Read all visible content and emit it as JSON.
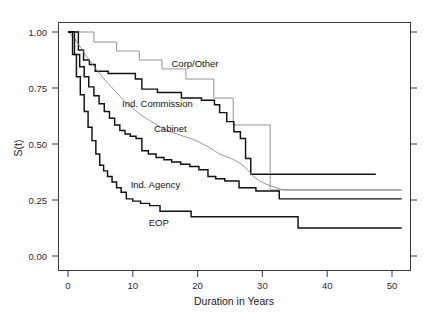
{
  "chart_data": {
    "type": "line",
    "title": "",
    "xlabel": "Duration in Years",
    "ylabel": "S(t)",
    "xlim": [
      0,
      52
    ],
    "ylim": [
      0,
      1.0
    ],
    "xticks": [
      0,
      10,
      20,
      30,
      40,
      50
    ],
    "xtick_labels": [
      "0",
      "10",
      "20",
      "30",
      "40",
      "50"
    ],
    "yticks": [
      0.0,
      0.25,
      0.5,
      0.75,
      1.0
    ],
    "ytick_labels": [
      "0.00",
      "0.25",
      "0.50",
      "0.75",
      "1.00"
    ],
    "grid": false,
    "legend_position": "inline-annotations",
    "step_style": "post",
    "series": [
      {
        "name": "Corp/Other",
        "style": "thin-gray",
        "color": "#8a8a8a",
        "label_x": 19.6,
        "label_y": 0.845,
        "x": [
          0,
          1.0,
          4.0,
          4.0,
          7.5,
          7.5,
          11.0,
          11.0,
          14.5,
          14.5,
          18.2,
          18.2,
          22.5,
          22.5,
          25.5,
          25.5,
          30.8,
          30.8,
          31.2,
          31.2,
          38.0,
          46.0,
          51.5
        ],
        "y": [
          1.0,
          1.0,
          1.0,
          0.955,
          0.955,
          0.915,
          0.915,
          0.875,
          0.875,
          0.835,
          0.835,
          0.79,
          0.79,
          0.705,
          0.705,
          0.585,
          0.585,
          0.585,
          0.585,
          0.295,
          0.295,
          0.295,
          0.295
        ]
      },
      {
        "name": "Ind. Commission",
        "style": "thick",
        "color": "#111111",
        "label_x": 13.8,
        "label_y": 0.663,
        "x": [
          0,
          1.6,
          1.6,
          2.4,
          2.4,
          3.3,
          3.3,
          4.2,
          4.2,
          6.2,
          6.2,
          10.4,
          10.4,
          11.4,
          11.4,
          13.8,
          13.8,
          17.5,
          17.5,
          20.6,
          20.6,
          22.6,
          22.6,
          23.4,
          23.4,
          24.5,
          24.5,
          25.6,
          25.6,
          26.6,
          26.6,
          27.4,
          27.4,
          28.2,
          28.2,
          33.0,
          40.0,
          47.5
        ],
        "y": [
          1.0,
          1.0,
          0.92,
          0.92,
          0.875,
          0.875,
          0.855,
          0.855,
          0.825,
          0.825,
          0.815,
          0.815,
          0.79,
          0.79,
          0.745,
          0.745,
          0.73,
          0.73,
          0.705,
          0.705,
          0.695,
          0.695,
          0.675,
          0.675,
          0.64,
          0.64,
          0.6,
          0.6,
          0.555,
          0.555,
          0.525,
          0.525,
          0.435,
          0.435,
          0.365,
          0.365,
          0.365,
          0.365
        ]
      },
      {
        "name": "Cabinet",
        "style": "thin-gray",
        "color": "#777777",
        "label_x": 15.8,
        "label_y": 0.555,
        "x": [
          0,
          0.9,
          1.5,
          2.2,
          3.0,
          3.8,
          4.6,
          5.4,
          6.2,
          7.0,
          7.8,
          8.6,
          9.4,
          10.2,
          11.0,
          11.8,
          12.6,
          13.4,
          14.2,
          15.0,
          15.8,
          16.8,
          17.8,
          18.8,
          19.8,
          20.8,
          21.8,
          22.6,
          23.4,
          24.3,
          25.2,
          26.2,
          27.2,
          28.0,
          28.6,
          29.6,
          30.6,
          31.6,
          32.6,
          33.2,
          36.0,
          42.0,
          48.0,
          51.5
        ],
        "y": [
          1.0,
          0.975,
          0.95,
          0.92,
          0.885,
          0.855,
          0.825,
          0.795,
          0.77,
          0.745,
          0.72,
          0.695,
          0.675,
          0.655,
          0.635,
          0.62,
          0.605,
          0.59,
          0.578,
          0.565,
          0.555,
          0.545,
          0.535,
          0.525,
          0.515,
          0.5,
          0.485,
          0.47,
          0.455,
          0.445,
          0.435,
          0.42,
          0.4,
          0.375,
          0.355,
          0.335,
          0.32,
          0.31,
          0.3,
          0.295,
          0.295,
          0.295,
          0.295,
          0.295
        ]
      },
      {
        "name": "Ind. Agency",
        "style": "thick",
        "color": "#111111",
        "label_x": 13.5,
        "label_y": 0.305,
        "x": [
          0,
          1.0,
          1.0,
          1.8,
          1.8,
          2.5,
          2.5,
          3.2,
          3.2,
          4.0,
          4.0,
          4.8,
          4.8,
          5.6,
          5.6,
          6.4,
          6.4,
          7.2,
          7.2,
          8.0,
          8.0,
          8.8,
          8.8,
          9.6,
          9.6,
          10.5,
          10.5,
          11.4,
          11.4,
          12.4,
          12.4,
          13.6,
          13.6,
          14.8,
          14.8,
          16.0,
          16.0,
          17.4,
          17.4,
          18.8,
          18.8,
          20.2,
          20.2,
          21.6,
          21.6,
          22.8,
          22.8,
          24.2,
          24.2,
          26.4,
          26.4,
          29.0,
          29.0,
          32.6,
          32.6,
          38.0,
          44.0,
          51.5
        ],
        "y": [
          1.0,
          1.0,
          0.9,
          0.9,
          0.845,
          0.845,
          0.8,
          0.8,
          0.755,
          0.755,
          0.715,
          0.715,
          0.68,
          0.68,
          0.645,
          0.645,
          0.615,
          0.615,
          0.585,
          0.585,
          0.56,
          0.56,
          0.545,
          0.545,
          0.535,
          0.535,
          0.525,
          0.525,
          0.47,
          0.47,
          0.455,
          0.455,
          0.44,
          0.44,
          0.43,
          0.43,
          0.42,
          0.42,
          0.41,
          0.41,
          0.4,
          0.4,
          0.385,
          0.385,
          0.355,
          0.355,
          0.345,
          0.345,
          0.335,
          0.335,
          0.305,
          0.305,
          0.29,
          0.29,
          0.255,
          0.255,
          0.255,
          0.255
        ]
      },
      {
        "name": "EOP",
        "style": "thick",
        "color": "#111111",
        "label_x": 14.0,
        "label_y": 0.135,
        "x": [
          0,
          0.7,
          0.7,
          1.3,
          1.3,
          1.9,
          1.9,
          2.5,
          2.5,
          3.1,
          3.1,
          3.7,
          3.7,
          4.3,
          4.3,
          4.9,
          4.9,
          5.5,
          5.5,
          6.1,
          6.1,
          6.8,
          6.8,
          7.5,
          7.5,
          8.2,
          8.2,
          9.0,
          9.0,
          10.0,
          10.0,
          11.2,
          11.2,
          12.6,
          12.6,
          14.2,
          14.2,
          19.0,
          19.0,
          35.5,
          35.5,
          44.0,
          51.5
        ],
        "y": [
          1.0,
          1.0,
          0.9,
          0.9,
          0.8,
          0.8,
          0.72,
          0.72,
          0.645,
          0.645,
          0.575,
          0.575,
          0.515,
          0.515,
          0.455,
          0.455,
          0.405,
          0.405,
          0.38,
          0.38,
          0.355,
          0.355,
          0.33,
          0.33,
          0.305,
          0.305,
          0.285,
          0.285,
          0.255,
          0.255,
          0.245,
          0.245,
          0.235,
          0.235,
          0.225,
          0.225,
          0.2,
          0.2,
          0.175,
          0.175,
          0.125,
          0.125,
          0.125
        ]
      }
    ]
  },
  "axes": {
    "ylabel": "S(t)",
    "xlabel": "Duration in Years",
    "ytick_labels": [
      "1.00",
      "0.75",
      "0.50",
      "0.25",
      "0.00"
    ],
    "xtick_labels": [
      "0",
      "10",
      "20",
      "30",
      "40",
      "50"
    ]
  },
  "annotations": {
    "corp_other": "Corp/Other",
    "ind_commission": "Ind. Commission",
    "cabinet": "Cabinet",
    "ind_agency": "Ind. Agency",
    "eop": "EOP"
  },
  "colors": {
    "curve_dark": "#111111",
    "curve_light": "#8a8a8a",
    "frame": "#3a3a3a",
    "background": "#ffffff"
  }
}
